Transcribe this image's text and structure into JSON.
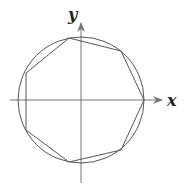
{
  "diagram": {
    "axes": {
      "x_label": "x",
      "y_label": "y"
    },
    "circle": {
      "cx": 81,
      "cy": 100,
      "r": 63
    },
    "polygon": {
      "sides": 7,
      "vertices": [
        [
          144,
          100
        ],
        [
          121,
          51
        ],
        [
          69,
          38
        ],
        [
          26,
          73
        ],
        [
          26,
          130
        ],
        [
          69,
          162
        ],
        [
          121,
          150
        ]
      ]
    },
    "colors": {
      "stroke": "#555555",
      "axis": "#777777",
      "background": "#ffffff"
    }
  }
}
